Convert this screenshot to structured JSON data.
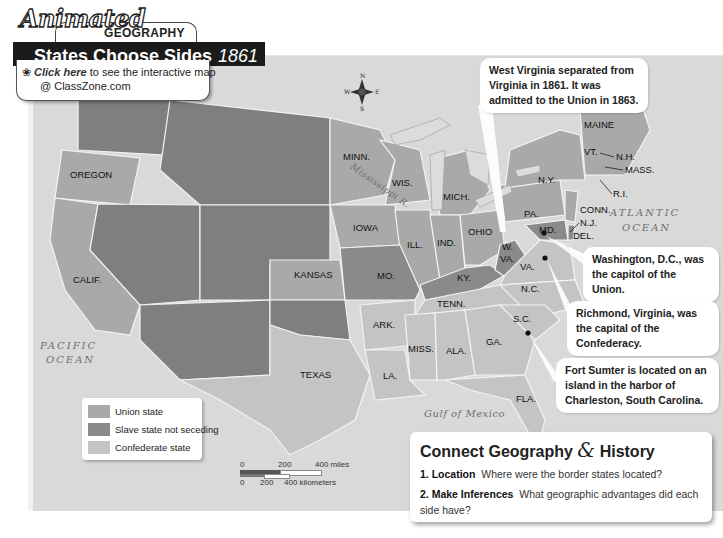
{
  "header": {
    "animated_label": "Animated",
    "section_label": "GEOGRAPHY",
    "title": "States Choose Sides",
    "year": "1861",
    "click_here_label": "Click here",
    "click_text": "to see the interactive map",
    "click_site": "@ ClassZone.com"
  },
  "compass": {
    "n": "N",
    "s": "S",
    "e": "E",
    "w": "W"
  },
  "callouts": {
    "west_virginia": "West Virginia separated from Virginia in 1861. It was admitted to the Union in 1863.",
    "washington": "Washington, D.C., was the capitol of the Union.",
    "richmond": "Richmond, Virginia, was the capital of the Confederacy.",
    "fort_sumter": "Fort Sumter is located on an island in the harbor of Charleston, South Carolina."
  },
  "water_labels": {
    "atlantic_1": "ATLANTIC",
    "atlantic_2": "OCEAN",
    "pacific_1": "PACIFIC",
    "pacific_2": "OCEAN",
    "gulf": "Gulf of Mexico",
    "river": "Mississippi R."
  },
  "states": {
    "oregon": "OREGON",
    "calif": "CALIF.",
    "kansas": "KANSAS",
    "texas": "TEXAS",
    "minn": "MINN.",
    "wis": "WIS.",
    "mich": "MICH.",
    "iowa": "IOWA",
    "ill": "ILL.",
    "ind": "IND.",
    "ohio": "OHIO",
    "mo": "MO.",
    "ky": "KY.",
    "wva1": "W.",
    "wva2": "VA.",
    "va": "VA.",
    "md": "MD.",
    "pa": "PA.",
    "ny": "N.Y.",
    "vt": "VT.",
    "maine": "MAINE",
    "nh": "N.H.",
    "mass": "MASS.",
    "ri": "R.I.",
    "conn": "CONN.",
    "nj": "N.J.",
    "del": "DEL.",
    "tenn": "TENN.",
    "nc": "N.C.",
    "sc": "S.C.",
    "ga": "GA.",
    "ala": "ALA.",
    "miss": "MISS.",
    "ark": "ARK.",
    "la": "LA.",
    "fla": "FLA."
  },
  "legend": {
    "items": [
      {
        "label": "Union state",
        "color": "#a9a9a9"
      },
      {
        "label": "Slave state not seceding",
        "color": "#8a8a8a"
      },
      {
        "label": "Confederate state",
        "color": "#c4c4c4"
      }
    ]
  },
  "scale": {
    "mi_0": "0",
    "mi_200": "200",
    "mi_400": "400 miles",
    "km_0": "0",
    "km_200": "200",
    "km_400": "400 kilometers"
  },
  "connect": {
    "title_a": "Connect Geography",
    "amp": "&",
    "title_b": "History",
    "q1_num": "1.",
    "q1_label": "Location",
    "q1_text": "Where were the border states located?",
    "q2_num": "2.",
    "q2_label": "Make Inferences",
    "q2_text": "What geographic advantages did each side have?"
  },
  "colors": {
    "union": "#a9a9a9",
    "border_slave": "#8a8a8a",
    "confederate": "#c4c4c4",
    "territory": "#7f7f7f",
    "water": "#d9d9d9"
  }
}
